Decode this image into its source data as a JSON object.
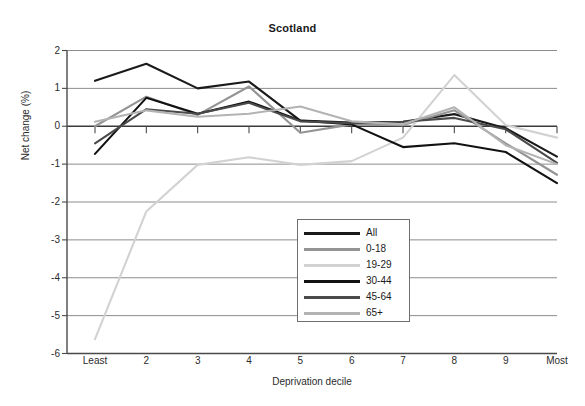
{
  "chart_data": {
    "type": "line",
    "title": "Scotland",
    "xlabel": "Deprivation decile",
    "ylabel": "Net change (%)",
    "categories": [
      "Least",
      "2",
      "3",
      "4",
      "5",
      "6",
      "7",
      "8",
      "9",
      "Most"
    ],
    "x_tick_labels": [
      "Least",
      "2",
      "3",
      "4",
      "5",
      "6",
      "7",
      "8",
      "9",
      "Most"
    ],
    "y_tick_labels": [
      "2",
      "1",
      "0",
      "-1",
      "-2",
      "-3",
      "-4",
      "-5",
      "-6"
    ],
    "ylim": [
      -6,
      2
    ],
    "xlim": [
      1,
      10
    ],
    "grid": true,
    "legend_position": "center",
    "series": [
      {
        "name": "All",
        "color": "#1a1a1a",
        "values": [
          1.2,
          1.65,
          1.0,
          1.18,
          0.15,
          0.1,
          0.12,
          0.32,
          -0.05,
          -0.8
        ]
      },
      {
        "name": "0-18",
        "color": "#949494",
        "values": [
          0.0,
          0.78,
          0.3,
          1.05,
          -0.17,
          0.05,
          0.03,
          0.42,
          -0.45,
          -1.28
        ]
      },
      {
        "name": "19-29",
        "color": "#d2d2d2",
        "values": [
          -5.62,
          -2.25,
          -1.02,
          -0.82,
          -1.02,
          -0.92,
          -0.3,
          1.35,
          0.03,
          -0.3
        ]
      },
      {
        "name": "30-44",
        "color": "#121212",
        "values": [
          -0.73,
          0.75,
          0.33,
          0.65,
          0.15,
          0.05,
          -0.55,
          -0.45,
          -0.68,
          -1.5
        ]
      },
      {
        "name": "45-64",
        "color": "#4a4a4a",
        "values": [
          -0.45,
          0.45,
          0.33,
          0.62,
          0.13,
          0.08,
          0.12,
          0.22,
          -0.08,
          -0.97
        ]
      },
      {
        "name": "65+",
        "color": "#b3b3b3",
        "values": [
          0.12,
          0.42,
          0.25,
          0.33,
          0.52,
          0.13,
          0.05,
          0.5,
          -0.5,
          -1.0
        ]
      }
    ]
  },
  "legend": {
    "items": [
      {
        "label": "All"
      },
      {
        "label": "0-18"
      },
      {
        "label": "19-29"
      },
      {
        "label": "30-44"
      },
      {
        "label": "45-64"
      },
      {
        "label": "65+"
      }
    ]
  }
}
